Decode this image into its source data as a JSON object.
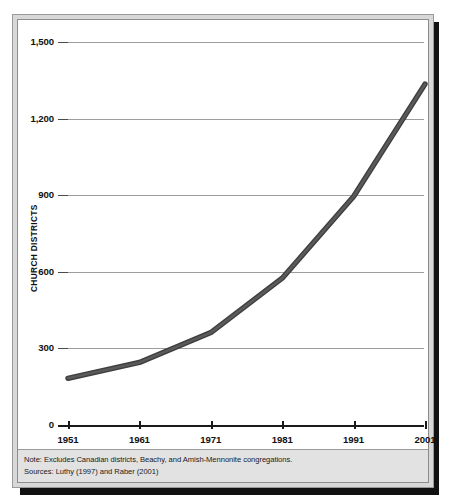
{
  "figure": {
    "note_lines": [
      "Note: Excludes Canadian districts, Beachy, and Amish-Mennonite congregations.",
      "Sources: Luthy (1997) and Raber (2001)"
    ],
    "line_color": "#5a5a5a",
    "gridline_color": "#9d9d9d",
    "axis_color": "#1a1a1a",
    "frame_color": "#d8d8d8",
    "note_background": "#e2e2e2"
  },
  "chart_data": {
    "type": "line",
    "title": "",
    "subtitle": "",
    "xlabel": "",
    "ylabel": "CHURCH DISTRICTS",
    "x": [
      1951,
      1961,
      1971,
      1981,
      1991,
      2001
    ],
    "xtick_labels": [
      "1951",
      "1961",
      "1971",
      "1981",
      "1991",
      "2001"
    ],
    "values": [
      183,
      245,
      362,
      575,
      895,
      1335
    ],
    "series": [
      {
        "name": "Church districts",
        "values": [
          183,
          245,
          362,
          575,
          895,
          1335
        ]
      }
    ],
    "ylim": [
      0,
      1500
    ],
    "xlim": [
      1951,
      2001
    ],
    "yticks": [
      0,
      300,
      600,
      900,
      1200,
      1500
    ],
    "ytick_labels": [
      "0",
      "300",
      "600",
      "900",
      "1,200",
      "1,500"
    ],
    "grid": true,
    "grid_axis": "y",
    "legend": false,
    "legend_position": "none",
    "annotations": [
      "Note: Excludes Canadian districts, Beachy, and Amish-Mennonite congregations.",
      "Sources: Luthy (1997) and Raber (2001)"
    ]
  }
}
